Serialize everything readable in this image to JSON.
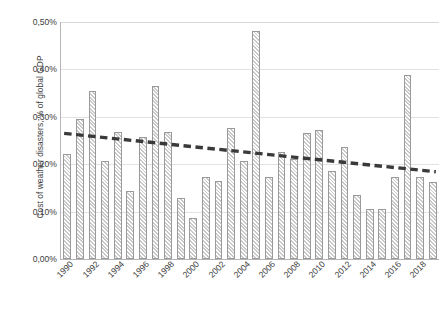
{
  "chart_data": {
    "type": "bar",
    "title": "",
    "subtitle": "",
    "xlabel": "",
    "ylabel": "Cost of weather disasters, % of global GDP",
    "ylim": [
      0.0,
      0.5
    ],
    "ytick_labels": [
      "0,00%",
      "0,10%",
      "0,20%",
      "0,30%",
      "0,40%",
      "0,50%"
    ],
    "ytick_values": [
      0.0,
      0.1,
      0.2,
      0.3,
      0.4,
      0.5
    ],
    "xtick_labels": [
      "1990",
      "1992",
      "1994",
      "1996",
      "1998",
      "2000",
      "2002",
      "2004",
      "2006",
      "2008",
      "2010",
      "2012",
      "2014",
      "2016",
      "2018"
    ],
    "grid": "horizontal",
    "legend": "none",
    "value_unit": "%",
    "categories": [
      "1990",
      "1991",
      "1992",
      "1993",
      "1994",
      "1995",
      "1996",
      "1997",
      "1998",
      "1999",
      "2000",
      "2001",
      "2002",
      "2003",
      "2004",
      "2005",
      "2006",
      "2007",
      "2008",
      "2009",
      "2010",
      "2011",
      "2012",
      "2013",
      "2014",
      "2015",
      "2016",
      "2017",
      "2018",
      "2019"
    ],
    "values": [
      0.222,
      0.295,
      0.355,
      0.207,
      0.268,
      0.144,
      0.258,
      0.366,
      0.268,
      0.129,
      0.086,
      0.172,
      0.165,
      0.276,
      0.207,
      0.481,
      0.173,
      0.225,
      0.211,
      0.265,
      0.272,
      0.185,
      0.237,
      0.136,
      0.106,
      0.105,
      0.172,
      0.389,
      0.172,
      0.163
    ],
    "series": [
      {
        "name": "Cost of weather disasters",
        "type": "bar",
        "values": [
          0.222,
          0.295,
          0.355,
          0.207,
          0.268,
          0.144,
          0.258,
          0.366,
          0.268,
          0.129,
          0.086,
          0.172,
          0.165,
          0.276,
          0.207,
          0.481,
          0.173,
          0.225,
          0.211,
          0.265,
          0.272,
          0.185,
          0.237,
          0.136,
          0.106,
          0.105,
          0.172,
          0.389,
          0.172,
          0.163
        ]
      },
      {
        "name": "Linear trend",
        "type": "line",
        "style": "dashed",
        "color": "#3a3a3a",
        "start_value": 0.265,
        "end_value": 0.184,
        "values": [
          0.265,
          0.2622,
          0.2594,
          0.2566,
          0.2538,
          0.251,
          0.2482,
          0.2454,
          0.2426,
          0.2398,
          0.237,
          0.2342,
          0.2314,
          0.2286,
          0.2258,
          0.223,
          0.2202,
          0.2174,
          0.2146,
          0.2118,
          0.209,
          0.2062,
          0.2034,
          0.2006,
          0.1978,
          0.195,
          0.1922,
          0.1894,
          0.1866,
          0.184
        ]
      }
    ],
    "colors": {
      "bar_fill": "#ffffff",
      "bar_hatch": "#c9c9c9",
      "bar_border": "#9a9a9a",
      "trend_line": "#3a3a3a",
      "gridline": "#e2e2e2",
      "axis": "#b5b5b5",
      "text": "#3c3c3c"
    }
  }
}
